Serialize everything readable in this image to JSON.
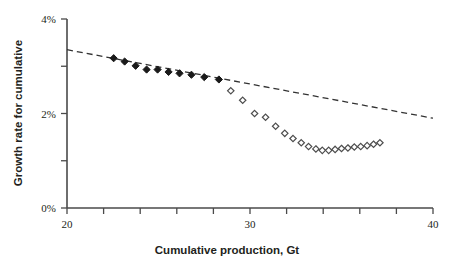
{
  "chart_data": {
    "type": "scatter",
    "title": "",
    "xlabel": "Cumulative production, Gt",
    "ylabel": "Growth rate for cumulative",
    "xlim": [
      20,
      40
    ],
    "ylim": [
      0,
      4
    ],
    "grid": false,
    "legend": "none",
    "x_ticks": [
      20,
      22,
      24,
      26,
      28,
      30,
      32,
      34,
      36,
      38,
      40
    ],
    "x_tick_labels": [
      "20",
      "",
      "",
      "",
      "",
      "30",
      "",
      "",
      "",
      "",
      "40"
    ],
    "y_ticks": [
      0,
      1,
      2,
      3,
      4
    ],
    "y_tick_labels": [
      "0%",
      "",
      "2%",
      "",
      "4%"
    ],
    "y_unit": "%",
    "series": [
      {
        "name": "Historical growth rate",
        "marker": "filled-diamond",
        "color": "#1a1a1a",
        "points": [
          {
            "x": 22.55,
            "y": 3.17
          },
          {
            "x": 23.15,
            "y": 3.1
          },
          {
            "x": 23.75,
            "y": 3.01
          },
          {
            "x": 24.35,
            "y": 2.93
          },
          {
            "x": 24.95,
            "y": 2.93
          },
          {
            "x": 25.55,
            "y": 2.88
          },
          {
            "x": 26.15,
            "y": 2.85
          },
          {
            "x": 26.8,
            "y": 2.82
          },
          {
            "x": 27.5,
            "y": 2.77
          },
          {
            "x": 28.3,
            "y": 2.72
          }
        ]
      },
      {
        "name": "Projected growth rate",
        "marker": "open-diamond",
        "color": "#4d4d4d",
        "points": [
          {
            "x": 28.95,
            "y": 2.48
          },
          {
            "x": 29.6,
            "y": 2.28
          },
          {
            "x": 30.25,
            "y": 2.0
          },
          {
            "x": 30.85,
            "y": 1.92
          },
          {
            "x": 31.4,
            "y": 1.73
          },
          {
            "x": 31.9,
            "y": 1.58
          },
          {
            "x": 32.35,
            "y": 1.47
          },
          {
            "x": 32.8,
            "y": 1.38
          },
          {
            "x": 33.2,
            "y": 1.3
          },
          {
            "x": 33.6,
            "y": 1.25
          },
          {
            "x": 33.95,
            "y": 1.22
          },
          {
            "x": 34.3,
            "y": 1.22
          },
          {
            "x": 34.65,
            "y": 1.24
          },
          {
            "x": 35.0,
            "y": 1.26
          },
          {
            "x": 35.35,
            "y": 1.27
          },
          {
            "x": 35.7,
            "y": 1.29
          },
          {
            "x": 36.05,
            "y": 1.3
          },
          {
            "x": 36.4,
            "y": 1.32
          },
          {
            "x": 36.75,
            "y": 1.35
          },
          {
            "x": 37.1,
            "y": 1.38
          }
        ]
      }
    ],
    "trend_line": {
      "name": "Linear trend",
      "style": "dashed",
      "color": "#333333",
      "x_start": 20.0,
      "y_start": 3.35,
      "x_end": 40.0,
      "y_end": 1.9
    }
  }
}
